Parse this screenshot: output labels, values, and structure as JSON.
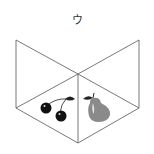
{
  "option_label": "ウ",
  "figure": {
    "line_color": "#555555",
    "items": [
      {
        "name": "cherries",
        "position": "left compartment",
        "color": "#111111"
      },
      {
        "name": "pear",
        "position": "right compartment",
        "color": "#8a8a8a"
      }
    ]
  }
}
